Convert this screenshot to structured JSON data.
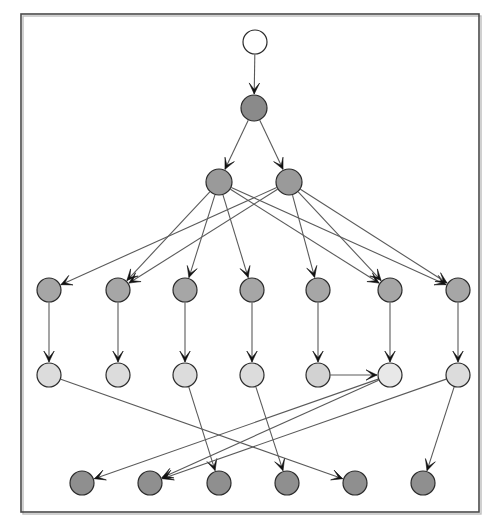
{
  "figure": {
    "kind": "directed-graph-diagram",
    "width": 500,
    "height": 532,
    "background_color": "#ffffff",
    "frame": {
      "x": 21,
      "y": 14,
      "width": 458,
      "height": 498,
      "stroke_color": "#4a4a4a",
      "fill": "none"
    }
  },
  "palette": {
    "node_root_fill": "#ffffff",
    "node_dark_fill": "#8a8a8a",
    "node_mid_fill": "#a6a6a6",
    "node_light_fill": "#dcdcdc",
    "node_lighter_fill": "#e6e6e6",
    "node_stroke": "#2b2b2b",
    "edge_stroke": "#5a5a5a",
    "arrowhead_fill": "#111111"
  },
  "graph_data": {
    "type": "node-link-diagram",
    "directed": true,
    "node_radius": 12,
    "levels": [
      {
        "index": 0,
        "y": 42,
        "count": 1,
        "shade": "root"
      },
      {
        "index": 1,
        "y": 108,
        "count": 1,
        "shade": "dark"
      },
      {
        "index": 2,
        "y": 182,
        "count": 2,
        "shade": "dark"
      },
      {
        "index": 3,
        "y": 290,
        "count": 7,
        "shade": "mid"
      },
      {
        "index": 4,
        "y": 375,
        "count": 7,
        "shade": "light"
      },
      {
        "index": 5,
        "y": 483,
        "count": 6,
        "shade": "dark"
      }
    ],
    "nodes": [
      {
        "id": "n0",
        "level": 0,
        "x": 255,
        "y": 42,
        "r": 12,
        "fill": "#ffffff"
      },
      {
        "id": "n1",
        "level": 1,
        "x": 254,
        "y": 108,
        "r": 13,
        "fill": "#8a8a8a"
      },
      {
        "id": "n2",
        "level": 2,
        "x": 219,
        "y": 182,
        "r": 13,
        "fill": "#9a9a9a"
      },
      {
        "id": "n3",
        "level": 2,
        "x": 289,
        "y": 182,
        "r": 13,
        "fill": "#9a9a9a"
      },
      {
        "id": "a1",
        "level": 3,
        "x": 49,
        "y": 290,
        "r": 12,
        "fill": "#a6a6a6"
      },
      {
        "id": "a2",
        "level": 3,
        "x": 118,
        "y": 290,
        "r": 12,
        "fill": "#a6a6a6"
      },
      {
        "id": "a3",
        "level": 3,
        "x": 185,
        "y": 290,
        "r": 12,
        "fill": "#a6a6a6"
      },
      {
        "id": "a4",
        "level": 3,
        "x": 252,
        "y": 290,
        "r": 12,
        "fill": "#a6a6a6"
      },
      {
        "id": "a5",
        "level": 3,
        "x": 318,
        "y": 290,
        "r": 12,
        "fill": "#a6a6a6"
      },
      {
        "id": "a6",
        "level": 3,
        "x": 390,
        "y": 290,
        "r": 12,
        "fill": "#a6a6a6"
      },
      {
        "id": "a7",
        "level": 3,
        "x": 458,
        "y": 290,
        "r": 12,
        "fill": "#a6a6a6"
      },
      {
        "id": "b1",
        "level": 4,
        "x": 49,
        "y": 375,
        "r": 12,
        "fill": "#dcdcdc"
      },
      {
        "id": "b2",
        "level": 4,
        "x": 118,
        "y": 375,
        "r": 12,
        "fill": "#dcdcdc"
      },
      {
        "id": "b3",
        "level": 4,
        "x": 185,
        "y": 375,
        "r": 12,
        "fill": "#dcdcdc"
      },
      {
        "id": "b4",
        "level": 4,
        "x": 252,
        "y": 375,
        "r": 12,
        "fill": "#dcdcdc"
      },
      {
        "id": "b5",
        "level": 4,
        "x": 318,
        "y": 375,
        "r": 12,
        "fill": "#d2d2d2"
      },
      {
        "id": "b6",
        "level": 4,
        "x": 390,
        "y": 375,
        "r": 12,
        "fill": "#e8e8e8"
      },
      {
        "id": "b7",
        "level": 4,
        "x": 458,
        "y": 375,
        "r": 12,
        "fill": "#dcdcdc"
      },
      {
        "id": "c1",
        "level": 5,
        "x": 82,
        "y": 483,
        "r": 12,
        "fill": "#8f8f8f"
      },
      {
        "id": "c2",
        "level": 5,
        "x": 150,
        "y": 483,
        "r": 12,
        "fill": "#8f8f8f"
      },
      {
        "id": "c3",
        "level": 5,
        "x": 219,
        "y": 483,
        "r": 12,
        "fill": "#8f8f8f"
      },
      {
        "id": "c4",
        "level": 5,
        "x": 287,
        "y": 483,
        "r": 12,
        "fill": "#8f8f8f"
      },
      {
        "id": "c5",
        "level": 5,
        "x": 355,
        "y": 483,
        "r": 12,
        "fill": "#8f8f8f"
      },
      {
        "id": "c6",
        "level": 5,
        "x": 423,
        "y": 483,
        "r": 12,
        "fill": "#8f8f8f"
      }
    ],
    "edges": [
      {
        "from": "n0",
        "to": "n1"
      },
      {
        "from": "n1",
        "to": "n2"
      },
      {
        "from": "n1",
        "to": "n3"
      },
      {
        "from": "n2",
        "to": "a2"
      },
      {
        "from": "n2",
        "to": "a3"
      },
      {
        "from": "n2",
        "to": "a4"
      },
      {
        "from": "n2",
        "to": "a6"
      },
      {
        "from": "n2",
        "to": "a7"
      },
      {
        "from": "n3",
        "to": "a1"
      },
      {
        "from": "n3",
        "to": "a2"
      },
      {
        "from": "n3",
        "to": "a5"
      },
      {
        "from": "n3",
        "to": "a6"
      },
      {
        "from": "n3",
        "to": "a7"
      },
      {
        "from": "a1",
        "to": "b1"
      },
      {
        "from": "a2",
        "to": "b2"
      },
      {
        "from": "a3",
        "to": "b3"
      },
      {
        "from": "a4",
        "to": "b4"
      },
      {
        "from": "a5",
        "to": "b5"
      },
      {
        "from": "a6",
        "to": "b6"
      },
      {
        "from": "a7",
        "to": "b7"
      },
      {
        "from": "b5",
        "to": "b6"
      },
      {
        "from": "b1",
        "to": "c5"
      },
      {
        "from": "b3",
        "to": "c3"
      },
      {
        "from": "b4",
        "to": "c4"
      },
      {
        "from": "b6",
        "to": "c1"
      },
      {
        "from": "b6",
        "to": "c2"
      },
      {
        "from": "b7",
        "to": "c2"
      },
      {
        "from": "b7",
        "to": "c6"
      }
    ]
  }
}
